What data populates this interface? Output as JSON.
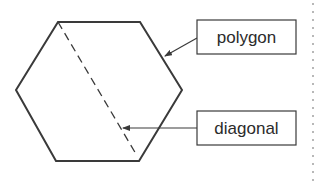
{
  "diagram": {
    "colors": {
      "stroke": "#3a3a3a",
      "background": "#ffffff",
      "dots": "#b8b8b8"
    },
    "shape": {
      "type": "hexagon",
      "vertices": [
        [
          58,
          22
        ],
        [
          140,
          22
        ],
        [
          182,
          90
        ],
        [
          139,
          161
        ],
        [
          56,
          161
        ],
        [
          16,
          90
        ]
      ]
    },
    "diagonal": {
      "style": "dashed",
      "from": [
        58,
        22
      ],
      "to": [
        136,
        154
      ]
    },
    "labels": [
      {
        "id": "polygon",
        "text": "polygon",
        "box": [
          197,
          20,
          99,
          34
        ],
        "arrow_from": [
          197,
          38
        ],
        "arrow_to": [
          164,
          57
        ]
      },
      {
        "id": "diagonal",
        "text": "diagonal",
        "box": [
          197,
          111,
          99,
          34
        ],
        "arrow_from": [
          197,
          128
        ],
        "arrow_to": [
          122,
          128
        ]
      }
    ],
    "right_edge_dots": {
      "x": 313,
      "spacing": 8
    }
  }
}
